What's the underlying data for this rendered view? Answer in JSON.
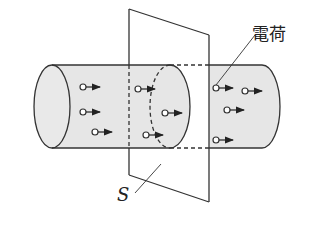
{
  "figure": {
    "labels": {
      "charge": "電荷",
      "plane": "S"
    },
    "colors": {
      "cylinder_fill": "#e6e6e6",
      "stroke": "#333333",
      "background": "#ffffff"
    },
    "charges": [
      {
        "x": 83,
        "y": 87
      },
      {
        "x": 83,
        "y": 112
      },
      {
        "x": 95,
        "y": 132
      },
      {
        "x": 138,
        "y": 89
      },
      {
        "x": 165,
        "y": 113
      },
      {
        "x": 146,
        "y": 135
      },
      {
        "x": 216,
        "y": 88
      },
      {
        "x": 245,
        "y": 91
      },
      {
        "x": 227,
        "y": 110
      },
      {
        "x": 216,
        "y": 140
      }
    ]
  }
}
